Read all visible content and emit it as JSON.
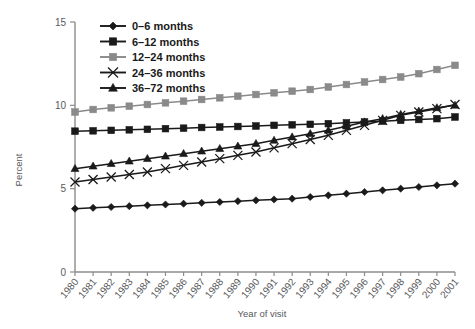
{
  "chart_data": {
    "type": "line",
    "title": "",
    "xlabel": "Year of visit",
    "ylabel": "Percent",
    "xlim": [
      1980,
      2001
    ],
    "ylim": [
      0,
      15
    ],
    "yticks": [
      0,
      5,
      10,
      15
    ],
    "ytick_labels": [
      "0",
      "5",
      "10",
      "15"
    ],
    "grid": false,
    "legend_position": "top-left",
    "categories": [
      "1980",
      "1981",
      "1982",
      "1983",
      "1984",
      "1985",
      "1986",
      "1987",
      "1988",
      "1989",
      "1990",
      "1991",
      "1992",
      "1993",
      "1994",
      "1995",
      "1996",
      "1997",
      "1998",
      "1999",
      "2000",
      "2001"
    ],
    "series": [
      {
        "name": "0–6 months",
        "marker": "diamond",
        "color": "#1a1a1a",
        "values": [
          3.8,
          3.85,
          3.9,
          3.95,
          4.0,
          4.05,
          4.1,
          4.15,
          4.2,
          4.25,
          4.3,
          4.35,
          4.4,
          4.5,
          4.6,
          4.7,
          4.8,
          4.9,
          5.0,
          5.1,
          5.2,
          5.3
        ]
      },
      {
        "name": "6–12 months",
        "marker": "square",
        "color": "#1a1a1a",
        "values": [
          8.45,
          8.47,
          8.5,
          8.53,
          8.56,
          8.6,
          8.63,
          8.67,
          8.7,
          8.73,
          8.76,
          8.8,
          8.83,
          8.86,
          8.9,
          8.95,
          9.0,
          9.05,
          9.1,
          9.15,
          9.2,
          9.3
        ]
      },
      {
        "name": "12–24 months",
        "marker": "square",
        "color": "#8a8a8a",
        "values": [
          9.6,
          9.75,
          9.85,
          9.95,
          10.05,
          10.15,
          10.25,
          10.35,
          10.45,
          10.55,
          10.65,
          10.75,
          10.85,
          10.95,
          11.1,
          11.25,
          11.4,
          11.55,
          11.7,
          11.9,
          12.15,
          12.4
        ]
      },
      {
        "name": "24–36 months",
        "marker": "x",
        "color": "#1a1a1a",
        "values": [
          5.4,
          5.55,
          5.7,
          5.85,
          6.0,
          6.2,
          6.4,
          6.6,
          6.8,
          7.0,
          7.2,
          7.45,
          7.7,
          7.95,
          8.2,
          8.5,
          8.8,
          9.1,
          9.4,
          9.6,
          9.8,
          10.05
        ]
      },
      {
        "name": "36–72 months",
        "marker": "triangle",
        "color": "#1a1a1a",
        "values": [
          6.2,
          6.35,
          6.5,
          6.65,
          6.8,
          6.95,
          7.1,
          7.25,
          7.4,
          7.55,
          7.7,
          7.9,
          8.1,
          8.3,
          8.5,
          8.75,
          9.0,
          9.2,
          9.45,
          9.65,
          9.85,
          10.0
        ]
      }
    ]
  },
  "legend": {
    "entries": [
      {
        "label": "0–6 months"
      },
      {
        "label": "6–12 months"
      },
      {
        "label": "12–24 months"
      },
      {
        "label": "24–36 months"
      },
      {
        "label": "36–72 months"
      }
    ]
  }
}
